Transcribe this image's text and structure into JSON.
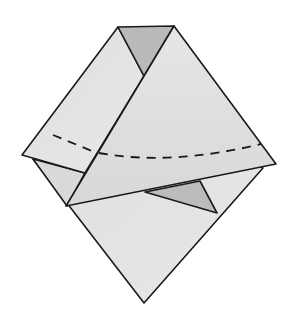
{
  "diagram": {
    "colors": {
      "paper_light": "#e4e4e4",
      "paper_mid": "#dadada",
      "paper_shadow": "#b9b9b9",
      "outline": "#1a1a1a",
      "background": "#ffffff"
    },
    "elements": [
      {
        "name": "back-diamond",
        "description": "bottom diamond layer"
      },
      {
        "name": "left-flap",
        "description": "left folded flap"
      },
      {
        "name": "top-shadow-triangle",
        "description": "dark gap triangle at top"
      },
      {
        "name": "front-flap",
        "description": "front folded triangular flap"
      },
      {
        "name": "inner-shadow-triangle",
        "description": "dark triangle under front flap"
      },
      {
        "name": "valley-fold-line",
        "description": "dashed fold line across middle"
      }
    ]
  }
}
